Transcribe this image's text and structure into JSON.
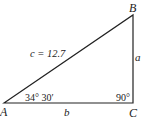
{
  "diagram": {
    "type": "right-triangle",
    "vertices": {
      "A": {
        "label": "A",
        "x": 4,
        "y": 103
      },
      "B": {
        "label": "B",
        "x": 133,
        "y": 15
      },
      "C": {
        "label": "C",
        "x": 133,
        "y": 103
      }
    },
    "sides": {
      "hypotenuse": {
        "label": "c = 12.7"
      },
      "vertical": {
        "label": "a"
      },
      "base": {
        "label": "b"
      }
    },
    "angles": {
      "A": {
        "label": "34° 30′"
      },
      "C": {
        "label": "90°"
      }
    },
    "colors": {
      "stroke": "#222222",
      "background": "#ffffff"
    }
  }
}
